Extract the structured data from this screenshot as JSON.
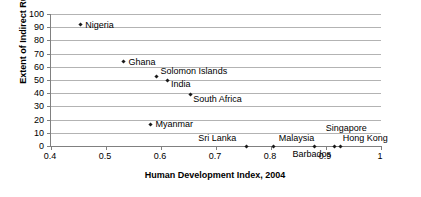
{
  "chart_data": {
    "type": "scatter",
    "title": "",
    "xlabel": "Human Development Index, 2004",
    "ylabel": "Extent of Indirect Rule",
    "xlim": [
      0.4,
      1.0
    ],
    "ylim": [
      0,
      100
    ],
    "xticks": [
      "0.4",
      "0.5",
      "0.6",
      "0.7",
      "0.8",
      "0.9",
      "1"
    ],
    "xtick_values": [
      0.4,
      0.5,
      0.6,
      0.7,
      0.8,
      0.9,
      1.0
    ],
    "yticks": [
      "100",
      "90",
      "80",
      "70",
      "60",
      "50",
      "40",
      "30",
      "20",
      "10",
      "0"
    ],
    "ytick_values": [
      100,
      90,
      80,
      70,
      60,
      50,
      40,
      30,
      20,
      10,
      0
    ],
    "grid": "horizontal",
    "legend": "none",
    "marker": "diamond",
    "marker_color": "#1a1a1a",
    "gridline_color": "#b3b3b3",
    "axis_color": "#808080",
    "points": [
      {
        "label": "Nigeria",
        "x": 0.453,
        "y": 92,
        "label_dx": 5,
        "label_dy": -5
      },
      {
        "label": "Ghana",
        "x": 0.532,
        "y": 64,
        "label_dx": 5,
        "label_dy": -5
      },
      {
        "label": "Solomon Islands",
        "x": 0.592,
        "y": 53,
        "label_dx": 4,
        "label_dy": -10
      },
      {
        "label": "India",
        "x": 0.611,
        "y": 49.5,
        "label_dx": 4,
        "label_dy": -2
      },
      {
        "label": "South Africa",
        "x": 0.653,
        "y": 39,
        "label_dx": 3,
        "label_dy": -1
      },
      {
        "label": "Myanmar",
        "x": 0.581,
        "y": 16.5,
        "label_dx": 5,
        "label_dy": -5
      },
      {
        "label": "Sri Lanka",
        "x": 0.755,
        "y": 0,
        "label_dx": -48,
        "label_dy": -13
      },
      {
        "label": "Malaysia",
        "x": 0.805,
        "y": 0,
        "label_dx": 5,
        "label_dy": -13
      },
      {
        "label": "Barbados",
        "x": 0.879,
        "y": 0,
        "label_dx": -22,
        "label_dy": 3
      },
      {
        "label": "Singapore",
        "x": 0.916,
        "y": 0,
        "label_dx": -9,
        "label_dy": -23
      },
      {
        "label": "Hong Kong",
        "x": 0.927,
        "y": 0,
        "label_dx": 2,
        "label_dy": -13
      }
    ]
  }
}
